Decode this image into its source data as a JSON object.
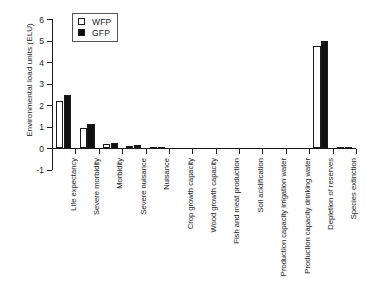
{
  "chart_data": {
    "type": "bar",
    "title": "",
    "subtitle": "",
    "xlabel": "",
    "ylabel": "Environmental load units (ELU)",
    "ylim": [
      -1,
      6
    ],
    "ytick_labels": [
      "6",
      "5",
      "4",
      "3",
      "2",
      "1",
      "0",
      "-1"
    ],
    "ytick_values": [
      6,
      5,
      4,
      3,
      2,
      1,
      0,
      -1
    ],
    "grid": false,
    "legend_position": "top-left-inside",
    "categories": [
      "Life expectancy",
      "Severe morbidity",
      "Morbidity",
      "Severe nuisance",
      "Nuisance",
      "Crop growth capacity",
      "Wood growth capacity",
      "Fish and meat production",
      "Soil acidification",
      "Production capacity irrigation water",
      "Production capacity drinking water",
      "Depletion of reserves",
      "Species extinction"
    ],
    "series": [
      {
        "name": "WFP",
        "color": "#ffffff",
        "edge_color": "#1a1a1a",
        "values": [
          2.2,
          0.95,
          0.2,
          0.1,
          0.03,
          0.0,
          0.0,
          0.0,
          0.0,
          0.0,
          0.0,
          4.75,
          0.05
        ]
      },
      {
        "name": "GFP",
        "color": "#101010",
        "edge_color": "#1a1a1a",
        "values": [
          2.45,
          1.1,
          0.25,
          0.15,
          0.04,
          0.0,
          0.0,
          0.0,
          0.0,
          0.0,
          0.0,
          5.0,
          0.07
        ]
      }
    ]
  },
  "legend": {
    "items": [
      {
        "label": "WFP",
        "swatch": "open-square"
      },
      {
        "label": "GFP",
        "swatch": "filled-square"
      }
    ]
  }
}
